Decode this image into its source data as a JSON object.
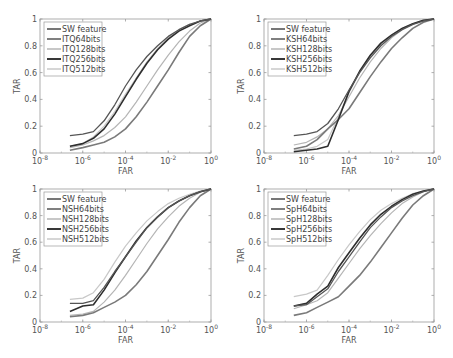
{
  "figure": {
    "width": 453,
    "height": 358,
    "xlabel": "FAR",
    "ylabel": "TAR"
  },
  "chart_data": [
    {
      "type": "line",
      "title": "",
      "xlabel": "FAR",
      "ylabel": "TAR",
      "xscale": "log",
      "xlim": [
        1e-08,
        1
      ],
      "ylim": [
        0,
        1
      ],
      "xticks": [
        "10^-8",
        "10^-6",
        "10^-4",
        "10^-2",
        "10^0"
      ],
      "yticks": [
        "0",
        "0.2",
        "0.4",
        "0.6",
        "0.8",
        "1"
      ],
      "grid": false,
      "legend_position": "upper left",
      "log10_x": [
        -6.6,
        -6,
        -5.5,
        -5,
        -4.5,
        -4,
        -3.5,
        -3,
        -2.5,
        -2,
        -1.5,
        -1,
        -0.5,
        0
      ],
      "series": [
        {
          "name": "SW feature",
          "color": "#555555",
          "width": 1.3,
          "values": [
            0.13,
            0.14,
            0.16,
            0.24,
            0.36,
            0.5,
            0.62,
            0.72,
            0.8,
            0.87,
            0.92,
            0.96,
            0.985,
            1.0
          ]
        },
        {
          "name": "ITQ64bits",
          "color": "#7a7a7a",
          "width": 1.6,
          "values": [
            0.02,
            0.04,
            0.06,
            0.08,
            0.12,
            0.18,
            0.27,
            0.38,
            0.5,
            0.62,
            0.75,
            0.87,
            0.95,
            1.0
          ]
        },
        {
          "name": "ITQ128bits",
          "color": "#b5b5b5",
          "width": 1.2,
          "values": [
            0.04,
            0.06,
            0.09,
            0.13,
            0.19,
            0.27,
            0.38,
            0.5,
            0.62,
            0.73,
            0.83,
            0.91,
            0.97,
            1.0
          ]
        },
        {
          "name": "ITQ256bits",
          "color": "#2e2e2e",
          "width": 1.6,
          "values": [
            0.05,
            0.07,
            0.11,
            0.18,
            0.29,
            0.42,
            0.55,
            0.67,
            0.77,
            0.85,
            0.91,
            0.95,
            0.985,
            1.0
          ]
        },
        {
          "name": "ITQ512bits",
          "color": "#c8c8c8",
          "width": 1.2,
          "values": [
            0.05,
            0.07,
            0.12,
            0.2,
            0.31,
            0.44,
            0.56,
            0.68,
            0.78,
            0.86,
            0.92,
            0.96,
            0.985,
            1.0
          ]
        }
      ]
    },
    {
      "type": "line",
      "title": "",
      "xlabel": "FAR",
      "ylabel": "TAR",
      "xscale": "log",
      "xlim": [
        1e-08,
        1
      ],
      "ylim": [
        0,
        1
      ],
      "xticks": [
        "10^-8",
        "10^-6",
        "10^-4",
        "10^-2",
        "10^0"
      ],
      "yticks": [
        "0",
        "0.2",
        "0.4",
        "0.6",
        "0.8",
        "1"
      ],
      "grid": false,
      "legend_position": "upper left",
      "log10_x": [
        -6.6,
        -6,
        -5.5,
        -5,
        -4.5,
        -4,
        -3.5,
        -3,
        -2.5,
        -2,
        -1.5,
        -1,
        -0.5,
        0
      ],
      "series": [
        {
          "name": "SW feature",
          "color": "#555555",
          "width": 1.3,
          "values": [
            0.13,
            0.14,
            0.16,
            0.22,
            0.33,
            0.47,
            0.6,
            0.71,
            0.8,
            0.87,
            0.92,
            0.96,
            0.985,
            1.0
          ]
        },
        {
          "name": "KSH64bits",
          "color": "#7a7a7a",
          "width": 1.6,
          "values": [
            0.03,
            0.05,
            0.1,
            0.18,
            0.25,
            0.33,
            0.45,
            0.57,
            0.68,
            0.78,
            0.86,
            0.93,
            0.975,
            1.0
          ]
        },
        {
          "name": "KSH128bits",
          "color": "#b5b5b5",
          "width": 1.2,
          "values": [
            0.06,
            0.08,
            0.12,
            0.18,
            0.28,
            0.42,
            0.56,
            0.68,
            0.78,
            0.86,
            0.92,
            0.96,
            0.985,
            1.0
          ]
        },
        {
          "name": "KSH256bits",
          "color": "#2e2e2e",
          "width": 1.6,
          "values": [
            0.01,
            0.02,
            0.03,
            0.05,
            0.25,
            0.46,
            0.61,
            0.73,
            0.82,
            0.88,
            0.93,
            0.965,
            0.99,
            1.0
          ]
        },
        {
          "name": "KSH512bits",
          "color": "#c8c8c8",
          "width": 1.2,
          "values": [
            0.02,
            0.03,
            0.05,
            0.1,
            0.27,
            0.45,
            0.6,
            0.72,
            0.81,
            0.88,
            0.93,
            0.965,
            0.99,
            1.0
          ]
        }
      ]
    },
    {
      "type": "line",
      "title": "",
      "xlabel": "FAR",
      "ylabel": "TAR",
      "xscale": "log",
      "xlim": [
        1e-08,
        1
      ],
      "ylim": [
        0,
        1
      ],
      "xticks": [
        "10^-8",
        "10^-6",
        "10^-4",
        "10^-2",
        "10^0"
      ],
      "yticks": [
        "0",
        "0.2",
        "0.4",
        "0.6",
        "0.8",
        "1"
      ],
      "grid": false,
      "legend_position": "upper left",
      "log10_x": [
        -6.6,
        -6,
        -5.5,
        -5,
        -4.5,
        -4,
        -3.5,
        -3,
        -2.5,
        -2,
        -1.5,
        -1,
        -0.5,
        0
      ],
      "series": [
        {
          "name": "SW feature",
          "color": "#555555",
          "width": 1.3,
          "values": [
            0.14,
            0.14,
            0.16,
            0.26,
            0.38,
            0.49,
            0.6,
            0.71,
            0.79,
            0.86,
            0.91,
            0.95,
            0.98,
            1.0
          ]
        },
        {
          "name": "NSH64bits",
          "color": "#7a7a7a",
          "width": 1.6,
          "values": [
            0.04,
            0.05,
            0.07,
            0.11,
            0.15,
            0.2,
            0.28,
            0.38,
            0.5,
            0.62,
            0.75,
            0.86,
            0.95,
            1.0
          ]
        },
        {
          "name": "NSH128bits",
          "color": "#b5b5b5",
          "width": 1.2,
          "values": [
            0.05,
            0.06,
            0.08,
            0.15,
            0.24,
            0.35,
            0.47,
            0.59,
            0.7,
            0.79,
            0.87,
            0.93,
            0.975,
            1.0
          ]
        },
        {
          "name": "NSH256bits",
          "color": "#2e2e2e",
          "width": 1.6,
          "values": [
            0.08,
            0.12,
            0.13,
            0.24,
            0.37,
            0.49,
            0.61,
            0.71,
            0.79,
            0.86,
            0.91,
            0.95,
            0.98,
            1.0
          ]
        },
        {
          "name": "NSH512bits",
          "color": "#c8c8c8",
          "width": 1.2,
          "values": [
            0.17,
            0.18,
            0.22,
            0.32,
            0.45,
            0.57,
            0.67,
            0.76,
            0.83,
            0.89,
            0.93,
            0.96,
            0.985,
            1.0
          ]
        }
      ]
    },
    {
      "type": "line",
      "title": "",
      "xlabel": "FAR",
      "ylabel": "TAR",
      "xscale": "log",
      "xlim": [
        1e-08,
        1
      ],
      "ylim": [
        0,
        1
      ],
      "xticks": [
        "10^-8",
        "10^-6",
        "10^-4",
        "10^-2",
        "10^0"
      ],
      "yticks": [
        "0",
        "0.2",
        "0.4",
        "0.6",
        "0.8",
        "1"
      ],
      "grid": false,
      "legend_position": "upper left",
      "log10_x": [
        -6.6,
        -6,
        -5.5,
        -5,
        -4.5,
        -4,
        -3.5,
        -3,
        -2.5,
        -2,
        -1.5,
        -1,
        -0.5,
        0
      ],
      "series": [
        {
          "name": "SW feature",
          "color": "#555555",
          "width": 1.3,
          "values": [
            0.12,
            0.13,
            0.19,
            0.25,
            0.38,
            0.49,
            0.6,
            0.71,
            0.79,
            0.86,
            0.91,
            0.95,
            0.98,
            1.0
          ]
        },
        {
          "name": "SpH64bits",
          "color": "#7a7a7a",
          "width": 1.6,
          "values": [
            0.05,
            0.07,
            0.11,
            0.15,
            0.19,
            0.27,
            0.35,
            0.45,
            0.56,
            0.67,
            0.78,
            0.88,
            0.95,
            1.0
          ]
        },
        {
          "name": "SpH128bits",
          "color": "#b5b5b5",
          "width": 1.2,
          "values": [
            0.1,
            0.13,
            0.16,
            0.22,
            0.33,
            0.44,
            0.55,
            0.65,
            0.74,
            0.82,
            0.89,
            0.94,
            0.98,
            1.0
          ]
        },
        {
          "name": "SpH256bits",
          "color": "#2e2e2e",
          "width": 1.6,
          "values": [
            0.12,
            0.14,
            0.21,
            0.27,
            0.41,
            0.52,
            0.63,
            0.73,
            0.81,
            0.87,
            0.92,
            0.96,
            0.985,
            1.0
          ]
        },
        {
          "name": "SpH512bits",
          "color": "#c8c8c8",
          "width": 1.2,
          "values": [
            0.19,
            0.21,
            0.24,
            0.35,
            0.47,
            0.58,
            0.68,
            0.77,
            0.84,
            0.89,
            0.93,
            0.965,
            0.985,
            1.0
          ]
        }
      ]
    }
  ],
  "panels": [
    {
      "x0": 40,
      "x1": 211,
      "y0": 19,
      "y1": 153
    },
    {
      "x0": 264,
      "x1": 434,
      "y0": 19,
      "y1": 153
    },
    {
      "x0": 40,
      "x1": 211,
      "y0": 189,
      "y1": 322
    },
    {
      "x0": 264,
      "x1": 434,
      "y0": 189,
      "y1": 322
    }
  ]
}
